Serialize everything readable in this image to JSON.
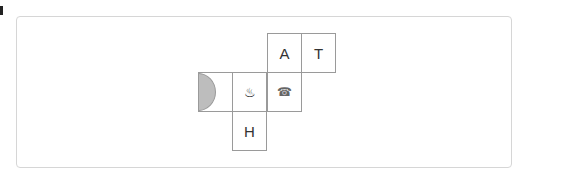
{
  "net": {
    "cells": [
      {
        "id": "A",
        "label": "A",
        "row": 0,
        "col": 2
      },
      {
        "id": "T",
        "label": "T",
        "row": 0,
        "col": 3
      },
      {
        "id": "semicircle",
        "label": "",
        "row": 1,
        "col": 0,
        "shape": "half-circle",
        "fill": "#bdbdbd"
      },
      {
        "id": "hot-springs",
        "label": "♨",
        "row": 1,
        "col": 1,
        "icon": "hot-springs-icon"
      },
      {
        "id": "telephone",
        "label": "☎",
        "row": 1,
        "col": 2,
        "icon": "telephone-icon"
      },
      {
        "id": "H",
        "label": "H",
        "row": 2,
        "col": 1
      }
    ]
  },
  "colors": {
    "border": "#9a9a9a",
    "panel_border": "#d6d6d6",
    "semicircle": "#bdbdbd"
  }
}
